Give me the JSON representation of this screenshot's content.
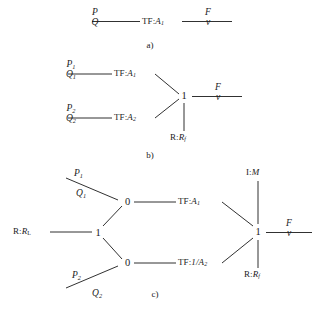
{
  "figure": {
    "kind": "bond-graph",
    "panels": [
      {
        "id": "a",
        "caption": "a)",
        "nodes": [
          {
            "name": "port-effort-flow-left",
            "type": "bond-label",
            "effort": "P",
            "flow": "Q"
          },
          {
            "name": "transformer",
            "type": "TF",
            "label_prefix": "TF",
            "label_value": "A",
            "label_sub": "1"
          },
          {
            "name": "port-effort-flow-right",
            "type": "bond-label",
            "effort": "F",
            "flow": "v"
          }
        ]
      },
      {
        "id": "b",
        "caption": "b)",
        "nodes": [
          {
            "name": "port-effort-flow-1",
            "type": "bond-label",
            "effort": "P",
            "effort_sub": "1",
            "flow": "Q",
            "flow_sub": "1"
          },
          {
            "name": "transformer-1",
            "type": "TF",
            "label_prefix": "TF",
            "label_value": "A",
            "label_sub": "1"
          },
          {
            "name": "port-effort-flow-2",
            "type": "bond-label",
            "effort": "P",
            "effort_sub": "2",
            "flow": "Q",
            "flow_sub": "2"
          },
          {
            "name": "transformer-2",
            "type": "TF",
            "label_prefix": "TF",
            "label_value": "A",
            "label_sub": "2"
          },
          {
            "name": "one-junction",
            "type": "1-junction",
            "label": "1"
          },
          {
            "name": "resistance-friction",
            "type": "R",
            "label_prefix": "R",
            "label_value": "R",
            "label_sub": "f"
          },
          {
            "name": "port-effort-flow-out",
            "type": "bond-label",
            "effort": "F",
            "flow": "v"
          }
        ]
      },
      {
        "id": "c",
        "caption": "c)",
        "nodes": [
          {
            "name": "port-effort-flow-1",
            "type": "bond-label",
            "effort": "P",
            "effort_sub": "1",
            "flow": "Q",
            "flow_sub": "1"
          },
          {
            "name": "port-effort-flow-2",
            "type": "bond-label",
            "effort": "P",
            "effort_sub": "2",
            "flow": "Q",
            "flow_sub": "2"
          },
          {
            "name": "resistance-load",
            "type": "R",
            "label_prefix": "R",
            "label_value": "R",
            "label_sub": "L"
          },
          {
            "name": "one-junction-left",
            "type": "1-junction",
            "label": "1"
          },
          {
            "name": "zero-junction-top",
            "type": "0-junction",
            "label": "0"
          },
          {
            "name": "zero-junction-bottom",
            "type": "0-junction",
            "label": "0"
          },
          {
            "name": "transformer-top",
            "type": "TF",
            "label_prefix": "TF",
            "label_value": "A",
            "label_sub": "1"
          },
          {
            "name": "transformer-bottom",
            "type": "TF",
            "label_prefix": "TF",
            "label_value": "1/A",
            "label_sub": "2"
          },
          {
            "name": "inertia-mass",
            "type": "I",
            "label_prefix": "I",
            "label_value": "M"
          },
          {
            "name": "one-junction-right",
            "type": "1-junction",
            "label": "1"
          },
          {
            "name": "resistance-friction",
            "type": "R",
            "label_prefix": "R",
            "label_value": "R",
            "label_sub": "f"
          },
          {
            "name": "port-effort-flow-out",
            "type": "bond-label",
            "effort": "F",
            "flow": "v"
          }
        ]
      }
    ]
  },
  "panel_a": {
    "caption": "a)",
    "left_effort": "P",
    "left_flow": "Q",
    "tf_prefix": "TF",
    "tf_value": "A",
    "tf_sub": "1",
    "right_effort": "F",
    "right_flow": "v"
  },
  "panel_b": {
    "caption": "b)",
    "effort_1": "P",
    "effort_1_sub": "1",
    "flow_1": "Q",
    "flow_1_sub": "1",
    "tf1_prefix": "TF",
    "tf1_value": "A",
    "tf1_sub": "1",
    "effort_2": "P",
    "effort_2_sub": "2",
    "flow_2": "Q",
    "flow_2_sub": "2",
    "tf2_prefix": "TF",
    "tf2_value": "A",
    "tf2_sub": "2",
    "junction": "1",
    "r_prefix": "R",
    "r_value": "R",
    "r_sub": "f",
    "out_effort": "F",
    "out_flow": "v"
  },
  "panel_c": {
    "caption": "c)",
    "effort_1": "P",
    "effort_1_sub": "1",
    "flow_1": "Q",
    "flow_1_sub": "1",
    "effort_2": "P",
    "effort_2_sub": "2",
    "flow_2": "Q",
    "flow_2_sub": "2",
    "rl_prefix": "R",
    "rl_value": "R",
    "rl_sub": "L",
    "junction_left": "1",
    "zero_top": "0",
    "zero_bottom": "0",
    "tf_top_prefix": "TF",
    "tf_top_value": "A",
    "tf_top_sub": "1",
    "tf_bottom_prefix": "TF",
    "tf_bottom_value": "1/A",
    "tf_bottom_sub": "2",
    "i_prefix": "I",
    "i_value": "M",
    "junction_right": "1",
    "rf_prefix": "R",
    "rf_value": "R",
    "rf_sub": "f",
    "out_effort": "F",
    "out_flow": "v"
  },
  "colors": {
    "ink": "#1a1a1a",
    "background": "#ffffff"
  }
}
